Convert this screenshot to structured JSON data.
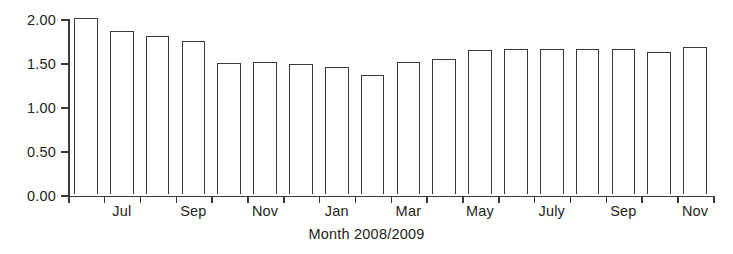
{
  "chart_data": {
    "type": "bar",
    "title": "",
    "xlabel": "Month 2008/2009",
    "ylabel": "",
    "ylim": [
      0.0,
      2.0
    ],
    "ytick_labels": [
      "0.00",
      "0.50",
      "1.00",
      "1.50",
      "2.00"
    ],
    "ytick_values": [
      0.0,
      0.5,
      1.0,
      1.5,
      2.0
    ],
    "grid": false,
    "legend": null,
    "bar_style": {
      "fill": "#ffffff",
      "edge": "#3a3a3a"
    },
    "categories": [
      "Jun",
      "Jul",
      "Aug",
      "Sep",
      "Oct",
      "Nov",
      "Dec",
      "Jan",
      "Feb",
      "Mar",
      "Apr",
      "May",
      "Jun",
      "July",
      "Aug",
      "Sep",
      "Oct",
      "Nov"
    ],
    "xtick_labels": [
      "",
      "Jul",
      "",
      "Sep",
      "",
      "Nov",
      "",
      "Jan",
      "",
      "Mar",
      "",
      "May",
      "",
      "July",
      "",
      "Sep",
      "",
      "Nov"
    ],
    "values": [
      1.99,
      1.84,
      1.78,
      1.72,
      1.47,
      1.49,
      1.46,
      1.43,
      1.34,
      1.49,
      1.52,
      1.62,
      1.63,
      1.64,
      1.64,
      1.64,
      1.6,
      1.66
    ]
  }
}
